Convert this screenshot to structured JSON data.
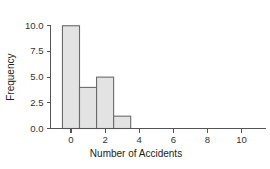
{
  "chart_data": {
    "type": "bar",
    "title": "",
    "subtitle": "",
    "xlabel": "Number of Accidents",
    "ylabel": "Frequency",
    "categories": [
      0,
      1,
      2,
      3
    ],
    "values": [
      10,
      4,
      5,
      1.2
    ],
    "bin_width": 1,
    "bar_edges": [
      -0.5,
      0.5,
      1.5,
      2.5,
      3.5
    ],
    "xlim": [
      -1.2,
      11.4
    ],
    "ylim": [
      0,
      10.9
    ],
    "xticks": [
      0,
      2,
      4,
      6,
      8,
      10
    ],
    "xtick_labels": [
      "0",
      "2",
      "4",
      "6",
      "8",
      "10"
    ],
    "yticks": [
      0,
      2.5,
      5,
      7.5,
      10
    ],
    "ytick_labels": [
      "0.0",
      "2.5",
      "5.0",
      "7.5",
      "10.0"
    ],
    "grid": false,
    "legend": null,
    "bar_fill_color": "#e3e3e3",
    "bar_edge_color": "#6a6a6a",
    "axis_color": "#555555",
    "background_color": "#ffffff"
  },
  "axes": {
    "y_title": "Frequency",
    "x_title": "Number of Accidents"
  }
}
